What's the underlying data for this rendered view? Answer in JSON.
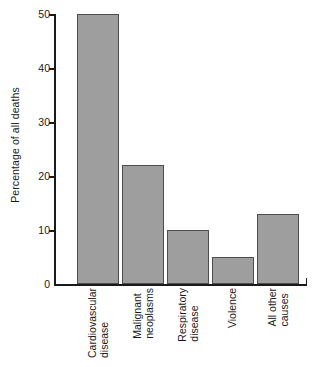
{
  "chart_data": {
    "type": "bar",
    "title": "",
    "xlabel": "",
    "ylabel": "Percentage of all deaths",
    "ylim": [
      0,
      50
    ],
    "yticks": [
      0,
      10,
      20,
      30,
      40,
      50
    ],
    "ytick_labels": [
      "0",
      "10",
      "20",
      "30",
      "40",
      "50"
    ],
    "grid": false,
    "legend": null,
    "categories": [
      "Cardiovascular disease",
      "Malignant neoplasms",
      "Respiratory disease",
      "Violence",
      "All other causes"
    ],
    "category_lines": [
      [
        "Cardiovascular",
        "disease"
      ],
      [
        "Malignant",
        "neoplasms"
      ],
      [
        "Respiratory",
        "disease"
      ],
      [
        "Violence"
      ],
      [
        "All other",
        "causes"
      ]
    ],
    "values": [
      50,
      22,
      10,
      5,
      13
    ],
    "bar_color": "#9e9e9e",
    "bar_edge_color": "#4d4d4d",
    "axis_color": "#1a1a1a",
    "background_color": "#ffffff"
  }
}
